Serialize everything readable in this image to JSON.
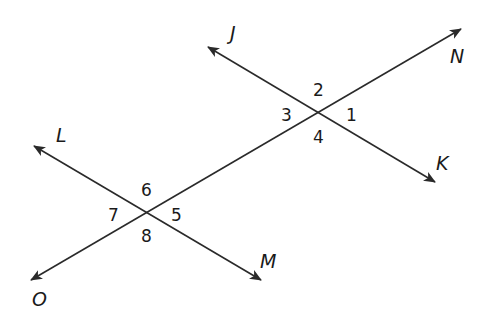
{
  "diagram": {
    "colors": {
      "line": "#2a2a2a",
      "text": "#1a1a1a",
      "background": "#ffffff"
    },
    "lines": [
      {
        "name": "transversal",
        "from_label": "O",
        "to_label": "N",
        "from": [
          31,
          280
        ],
        "to": [
          461,
          29
        ]
      },
      {
        "name": "line-JK",
        "from_label": "J",
        "to_label": "K",
        "from": [
          208,
          47
        ],
        "to": [
          435,
          182
        ]
      },
      {
        "name": "line-LM",
        "from_label": "L",
        "to_label": "M",
        "from": [
          34,
          146
        ],
        "to": [
          261,
          280
        ]
      }
    ],
    "point_labels": [
      {
        "text": "J",
        "x": 230,
        "y": 40
      },
      {
        "text": "N",
        "x": 450,
        "y": 63
      },
      {
        "text": "K",
        "x": 436,
        "y": 170
      },
      {
        "text": "L",
        "x": 56,
        "y": 142
      },
      {
        "text": "M",
        "x": 260,
        "y": 268
      },
      {
        "text": "O",
        "x": 32,
        "y": 306
      }
    ],
    "angle_labels": [
      {
        "text": "1",
        "x": 346,
        "y": 121
      },
      {
        "text": "2",
        "x": 313,
        "y": 96
      },
      {
        "text": "3",
        "x": 281,
        "y": 121
      },
      {
        "text": "4",
        "x": 313,
        "y": 143
      },
      {
        "text": "5",
        "x": 171,
        "y": 221
      },
      {
        "text": "6",
        "x": 141,
        "y": 196
      },
      {
        "text": "7",
        "x": 108,
        "y": 221
      },
      {
        "text": "8",
        "x": 141,
        "y": 242
      }
    ]
  }
}
